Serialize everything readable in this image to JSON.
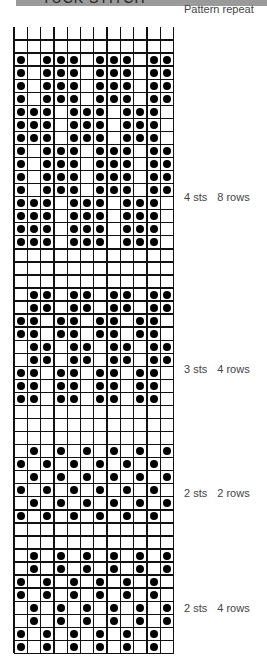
{
  "header": {
    "title": "TUCK STITCH"
  },
  "legend": {
    "pattern_repeat": "Pattern repeat"
  },
  "grid": {
    "columns": 12,
    "cell_width": 13.3,
    "row_height": 13.05
  },
  "sections": [
    {
      "label_sts": "4 sts",
      "label_rows": "8 rows",
      "label_y": 191,
      "rows": [
        [
          0,
          0,
          0,
          0,
          0,
          0,
          0,
          0,
          0,
          0,
          0,
          0
        ],
        [
          0,
          0,
          0,
          0,
          0,
          0,
          0,
          0,
          0,
          0,
          0,
          0
        ],
        [
          1,
          0,
          1,
          1,
          1,
          0,
          1,
          1,
          1,
          0,
          1,
          1
        ],
        [
          1,
          0,
          1,
          1,
          1,
          0,
          1,
          1,
          1,
          0,
          1,
          1
        ],
        [
          1,
          0,
          1,
          1,
          1,
          0,
          1,
          1,
          1,
          0,
          1,
          1
        ],
        [
          1,
          0,
          1,
          1,
          1,
          0,
          1,
          1,
          1,
          0,
          1,
          1
        ],
        [
          1,
          1,
          1,
          0,
          1,
          1,
          1,
          0,
          1,
          1,
          1,
          0
        ],
        [
          1,
          1,
          1,
          0,
          1,
          1,
          1,
          0,
          1,
          1,
          1,
          0
        ],
        [
          1,
          1,
          1,
          0,
          1,
          1,
          1,
          0,
          1,
          1,
          1,
          0
        ],
        [
          1,
          0,
          1,
          1,
          1,
          0,
          1,
          1,
          1,
          0,
          1,
          1
        ],
        [
          1,
          0,
          1,
          1,
          1,
          0,
          1,
          1,
          1,
          0,
          1,
          1
        ],
        [
          1,
          0,
          1,
          1,
          1,
          0,
          1,
          1,
          1,
          0,
          1,
          1
        ],
        [
          1,
          0,
          1,
          1,
          1,
          0,
          1,
          1,
          1,
          0,
          1,
          1
        ],
        [
          1,
          1,
          1,
          0,
          1,
          1,
          1,
          0,
          1,
          1,
          1,
          0
        ],
        [
          1,
          1,
          1,
          0,
          1,
          1,
          1,
          0,
          1,
          1,
          1,
          0
        ],
        [
          1,
          1,
          1,
          0,
          1,
          1,
          1,
          0,
          1,
          1,
          1,
          0
        ],
        [
          1,
          1,
          1,
          0,
          1,
          1,
          1,
          0,
          1,
          1,
          1,
          0
        ]
      ]
    },
    {
      "label_sts": "3 sts",
      "label_rows": "4 rows",
      "label_y": 363,
      "rows": [
        [
          0,
          0,
          0,
          0,
          0,
          0,
          0,
          0,
          0,
          0,
          0,
          0
        ],
        [
          0,
          0,
          0,
          0,
          0,
          0,
          0,
          0,
          0,
          0,
          0,
          0
        ],
        [
          0,
          0,
          0,
          0,
          0,
          0,
          0,
          0,
          0,
          0,
          0,
          0
        ],
        [
          0,
          1,
          1,
          0,
          1,
          1,
          0,
          1,
          1,
          0,
          1,
          1
        ],
        [
          0,
          1,
          1,
          0,
          1,
          1,
          0,
          1,
          1,
          0,
          1,
          1
        ],
        [
          1,
          1,
          0,
          1,
          1,
          0,
          1,
          1,
          0,
          1,
          1,
          0
        ],
        [
          1,
          1,
          0,
          1,
          1,
          0,
          1,
          1,
          0,
          1,
          1,
          0
        ],
        [
          0,
          1,
          1,
          0,
          1,
          1,
          0,
          1,
          1,
          0,
          1,
          1
        ],
        [
          0,
          1,
          1,
          0,
          1,
          1,
          0,
          1,
          1,
          0,
          1,
          1
        ],
        [
          1,
          1,
          0,
          1,
          1,
          0,
          1,
          1,
          0,
          1,
          1,
          0
        ],
        [
          1,
          1,
          0,
          1,
          1,
          0,
          1,
          1,
          0,
          1,
          1,
          0
        ],
        [
          1,
          1,
          0,
          1,
          1,
          0,
          1,
          1,
          0,
          1,
          1,
          0
        ]
      ]
    },
    {
      "label_sts": "2 sts",
      "label_rows": "2 rows",
      "label_y": 487,
      "rows": [
        [
          0,
          0,
          0,
          0,
          0,
          0,
          0,
          0,
          0,
          0,
          0,
          0
        ],
        [
          0,
          0,
          0,
          0,
          0,
          0,
          0,
          0,
          0,
          0,
          0,
          0
        ],
        [
          0,
          0,
          0,
          0,
          0,
          0,
          0,
          0,
          0,
          0,
          0,
          0
        ],
        [
          0,
          1,
          0,
          1,
          0,
          1,
          0,
          1,
          0,
          1,
          0,
          1
        ],
        [
          1,
          0,
          1,
          0,
          1,
          0,
          1,
          0,
          1,
          0,
          1,
          0
        ],
        [
          0,
          1,
          0,
          1,
          0,
          1,
          0,
          1,
          0,
          1,
          0,
          1
        ],
        [
          1,
          0,
          1,
          0,
          1,
          0,
          1,
          0,
          1,
          0,
          1,
          0
        ],
        [
          0,
          1,
          0,
          1,
          0,
          1,
          0,
          1,
          0,
          1,
          0,
          1
        ],
        [
          1,
          0,
          1,
          0,
          1,
          0,
          1,
          0,
          1,
          0,
          1,
          0
        ]
      ]
    },
    {
      "label_sts": "2 sts",
      "label_rows": "4 rows",
      "label_y": 602,
      "rows": [
        [
          0,
          0,
          0,
          0,
          0,
          0,
          0,
          0,
          0,
          0,
          0,
          0
        ],
        [
          0,
          0,
          0,
          0,
          0,
          0,
          0,
          0,
          0,
          0,
          0,
          0
        ],
        [
          0,
          1,
          0,
          1,
          0,
          1,
          0,
          1,
          0,
          1,
          0,
          1
        ],
        [
          0,
          1,
          0,
          1,
          0,
          1,
          0,
          1,
          0,
          1,
          0,
          1
        ],
        [
          1,
          0,
          1,
          0,
          1,
          0,
          1,
          0,
          1,
          0,
          1,
          0
        ],
        [
          1,
          0,
          1,
          0,
          1,
          0,
          1,
          0,
          1,
          0,
          1,
          0
        ],
        [
          0,
          1,
          0,
          1,
          0,
          1,
          0,
          1,
          0,
          1,
          0,
          1
        ],
        [
          0,
          1,
          0,
          1,
          0,
          1,
          0,
          1,
          0,
          1,
          0,
          1
        ],
        [
          1,
          0,
          1,
          0,
          1,
          0,
          1,
          0,
          1,
          0,
          1,
          0
        ],
        [
          1,
          0,
          1,
          0,
          1,
          0,
          1,
          0,
          1,
          0,
          1,
          0
        ]
      ]
    }
  ],
  "colors": {
    "grid": "#111111",
    "dot": "#000000",
    "header_bar": "#9a9a9a",
    "label": "#444444"
  }
}
